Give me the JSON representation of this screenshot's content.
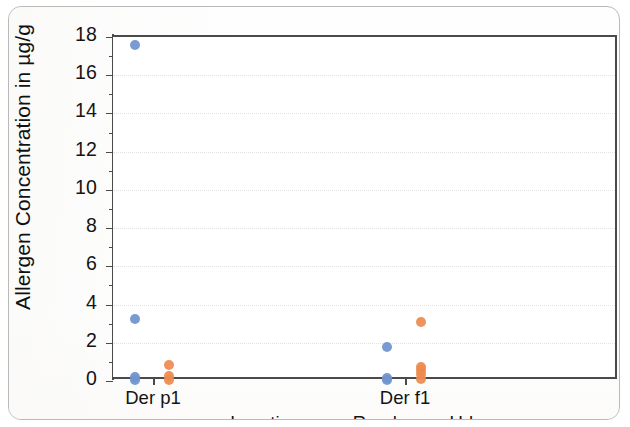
{
  "chart_data": {
    "type": "scatter",
    "title": "",
    "xlabel": "",
    "ylabel": "Allergen Concentration in µg/g",
    "categories": [
      "Der p1",
      "Der f1"
    ],
    "ylim": [
      0,
      18
    ],
    "yticks": [
      0,
      2,
      4,
      6,
      8,
      10,
      12,
      14,
      16,
      18
    ],
    "ytick_labels": [
      "0",
      "2",
      "4",
      "6",
      "8",
      "10",
      "12",
      "14",
      "16",
      "18"
    ],
    "grid": "horizontal-dotted",
    "legend_position": "bottom-center",
    "legend_title": "Location",
    "series": [
      {
        "name": "Rural",
        "color": "#6f93cf",
        "points": [
          {
            "category": "Der p1",
            "value": 17.6
          },
          {
            "category": "Der p1",
            "value": 3.25
          },
          {
            "category": "Der p1",
            "value": 0.2
          },
          {
            "category": "Der p1",
            "value": 0.05
          },
          {
            "category": "Der f1",
            "value": 1.8
          },
          {
            "category": "Der f1",
            "value": 0.15
          },
          {
            "category": "Der f1",
            "value": 0.05
          }
        ]
      },
      {
        "name": "Urban",
        "color": "#ed8b50",
        "points": [
          {
            "category": "Der p1",
            "value": 0.85
          },
          {
            "category": "Der p1",
            "value": 0.25
          },
          {
            "category": "Der p1",
            "value": 0.05
          },
          {
            "category": "Der f1",
            "value": 3.1
          },
          {
            "category": "Der f1",
            "value": 0.75
          },
          {
            "category": "Der f1",
            "value": 0.55
          },
          {
            "category": "Der f1",
            "value": 0.35
          },
          {
            "category": "Der f1",
            "value": 0.1
          }
        ]
      }
    ]
  },
  "legend": {
    "title": "Location",
    "entries": [
      {
        "label": "Rural",
        "color": "#6f93cf"
      },
      {
        "label": "Urban",
        "color": "#ed8b50"
      }
    ]
  },
  "axis": {
    "y_title": "Allergen Concentration in µg/g"
  }
}
